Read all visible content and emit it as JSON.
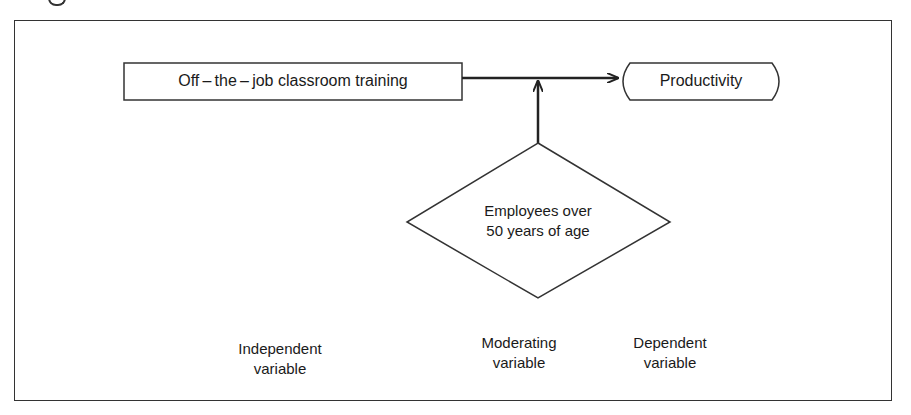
{
  "figure": {
    "nodes": {
      "independent": {
        "label": "Off – the – job classroom training",
        "shape": "rectangle"
      },
      "dependent": {
        "label": "Productivity",
        "shape": "rounded-display"
      },
      "moderator": {
        "line1": "Employees over",
        "line2": "50 years of age",
        "shape": "diamond"
      }
    },
    "edges": [
      {
        "from": "independent",
        "to": "dependent",
        "type": "arrow"
      },
      {
        "from": "moderator",
        "to": "independent-dependent-link",
        "type": "arrow"
      }
    ],
    "captions": {
      "independent": {
        "line1": "Independent",
        "line2": "variable"
      },
      "moderating": {
        "line1": "Moderating",
        "line2": "variable"
      },
      "dependent": {
        "line1": "Dependent",
        "line2": "variable"
      }
    }
  },
  "colors": {
    "stroke": "#333333",
    "text": "#1a1a1a",
    "background": "#ffffff"
  }
}
